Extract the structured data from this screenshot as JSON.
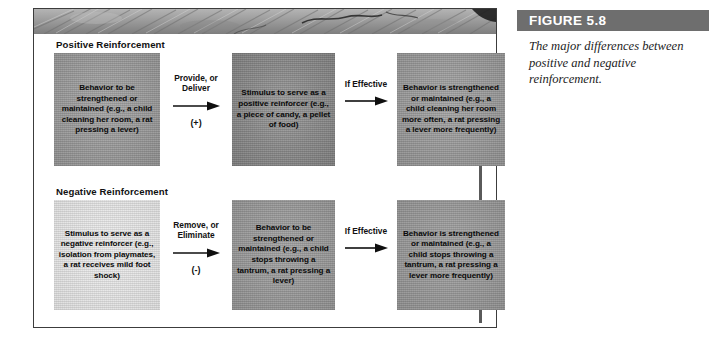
{
  "figure": {
    "title": "FIGURE 5.8",
    "caption": "The major differences between positive and negative reinforcement.",
    "title_bar_color": "#6e6e6e",
    "frame_border_color": "#3c3c3c",
    "canvas_color": "#ffffff"
  },
  "sections": [
    {
      "id": "positive",
      "title": "Positive Reinforcement",
      "boxes": [
        {
          "id": "pos-box-1",
          "text": "Behavior to be strengthened or maintained (e.g., a child cleaning her room, a rat pressing a lever)",
          "tone": "#9a9a9a"
        },
        {
          "id": "pos-box-2",
          "text": "Stimulus to serve as a positive reinforcer (e.g., a piece of candy, a pellet of food)",
          "tone": "#8b8b8b"
        },
        {
          "id": "pos-box-3",
          "text": "Behavior is strengthened or maintained (e.g., a child cleaning her room more often, a rat pressing a lever more frequently)",
          "tone": "#9a9a9a"
        }
      ],
      "connectors": [
        {
          "id": "pos-conn-1",
          "label": "Provide, or\nDeliver",
          "sign": "(+)"
        },
        {
          "id": "pos-conn-2",
          "label": "If Effective",
          "sign": ""
        }
      ]
    },
    {
      "id": "negative",
      "title": "Negative Reinforcement",
      "boxes": [
        {
          "id": "neg-box-1",
          "text": "Stimulus to serve as a negative reinforcer (e.g., isolation from playmates, a rat receives mild foot shock)",
          "tone": "#e4e4e4"
        },
        {
          "id": "neg-box-2",
          "text": "Behavior to be strengthened or maintained (e.g., a child stops throwing a tantrum, a rat pressing a lever)",
          "tone": "#999999"
        },
        {
          "id": "neg-box-3",
          "text": "Behavior is strengthened or maintained (e.g., a child stops throwing a tantrum, a rat pressing a lever more frequently)",
          "tone": "#999999"
        }
      ],
      "connectors": [
        {
          "id": "neg-conn-1",
          "label": "Remove, or\nEliminate",
          "sign": "(-)"
        },
        {
          "id": "neg-conn-2",
          "label": "If Effective",
          "sign": ""
        }
      ]
    }
  ]
}
